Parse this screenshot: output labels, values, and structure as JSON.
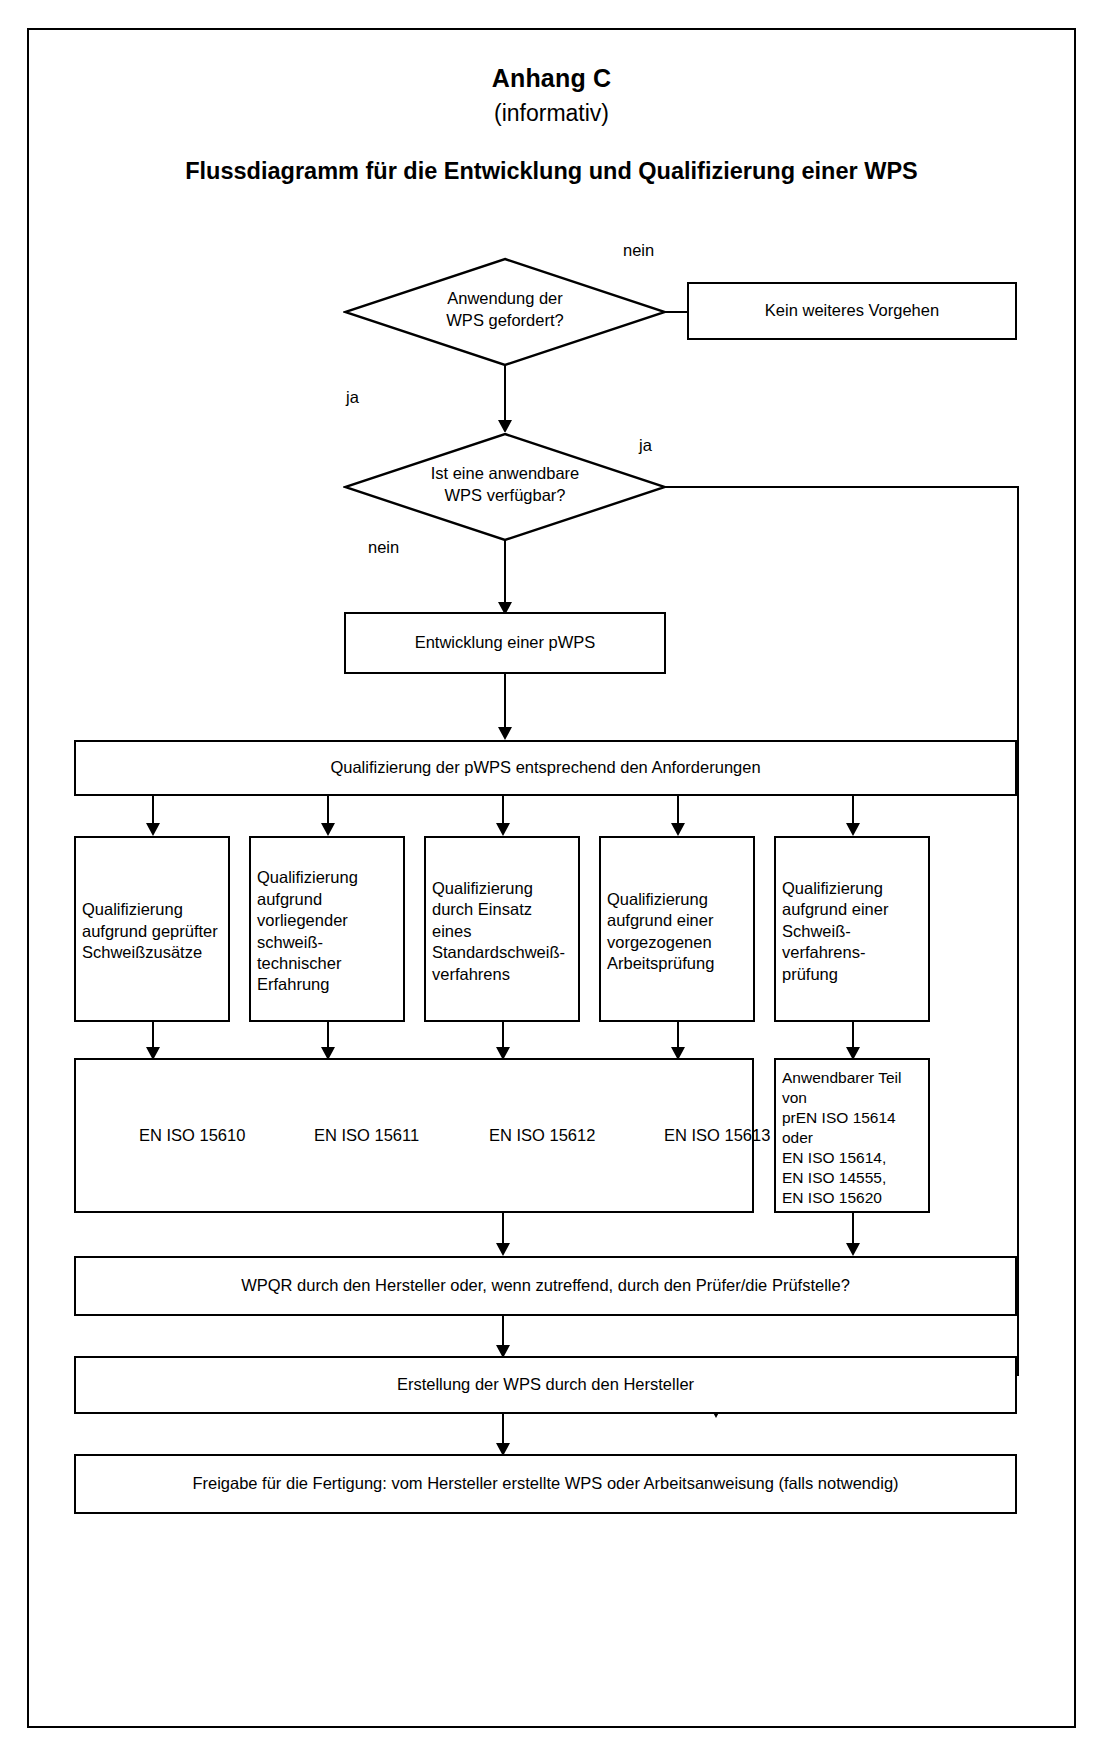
{
  "document": {
    "annex_title": "Anhang C",
    "annex_kind": "(informativ)",
    "figure_title": "Flussdiagramm für die Entwicklung und Qualifizierung einer WPS"
  },
  "flowchart": {
    "type": "flowchart",
    "decisions": [
      {
        "id": "d1",
        "text_lines": [
          "Anwendung der",
          "WPS gefordert?"
        ],
        "branches": [
          {
            "label": "nein",
            "target": "no-further-action"
          },
          {
            "label": "ja",
            "target": "d2"
          }
        ]
      },
      {
        "id": "d2",
        "text_lines": [
          "Ist eine anwendbare",
          "WPS verfügbar?"
        ],
        "branches": [
          {
            "label": "ja",
            "target": "release"
          },
          {
            "label": "nein",
            "target": "develop-pwps"
          }
        ]
      }
    ],
    "nodes": {
      "no_further_action": "Kein weiteres Vorgehen",
      "develop_pwps": "Entwicklung einer pWPS",
      "qualification_bar": "Qualifizierung der pWPS entsprechend den Anforderungen",
      "wpqr_bar": "WPQR durch den Hersteller oder, wenn zutreffend, durch den Prüfer/die Prüfstelle?",
      "create_wps_bar": "Erstellung der WPS durch den Hersteller",
      "release_bar": "Freigabe für die Fertigung: vom Hersteller erstellte WPS oder Arbeitsanweisung (falls notwendig)"
    },
    "qualification_methods": [
      {
        "lines": [
          "Qualifizierung",
          "aufgrund geprüfter",
          "Schweißzusätze"
        ],
        "standard": "EN ISO 15610"
      },
      {
        "lines": [
          "Qualifizierung",
          "aufgrund",
          "vorliegender",
          "schweiß-",
          "technischer",
          "Erfahrung"
        ],
        "standard": "EN ISO 15611"
      },
      {
        "lines": [
          "Qualifizierung",
          "durch Einsatz",
          "eines",
          "Standardschweiß-",
          "verfahrens"
        ],
        "standard": "EN ISO 15612"
      },
      {
        "lines": [
          "Qualifizierung",
          "aufgrund einer",
          "vorgezogenen",
          "Arbeitsprüfung"
        ],
        "standard": "EN ISO 15613"
      },
      {
        "lines": [
          "Qualifizierung",
          "aufgrund einer",
          "Schweiß-",
          "verfahrens-",
          "prüfung"
        ],
        "standard": null
      }
    ],
    "standards_row": {
      "labels": [
        "EN ISO 15610",
        "EN ISO 15611",
        "EN ISO 15612",
        "EN ISO 15613"
      ],
      "applicable_part_box": [
        "Anwendbarer Teil",
        "von",
        "prEN ISO 15614",
        "oder",
        "EN ISO 15614,",
        "EN ISO 14555,",
        "EN ISO 15620"
      ]
    },
    "edge_labels": {
      "d1_no": "nein",
      "d1_yes": "ja",
      "d2_yes": "ja",
      "d2_no": "nein"
    }
  },
  "colors": {
    "line": "#000000",
    "background": "#ffffff"
  }
}
